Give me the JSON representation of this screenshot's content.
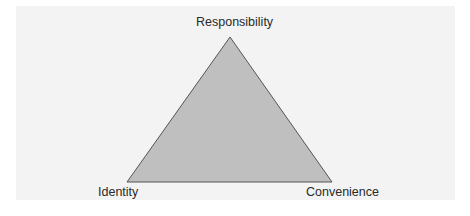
{
  "diagram": {
    "type": "triangle",
    "vertices": {
      "top": "Responsibility",
      "bottom_left": "Identity",
      "bottom_right": "Convenience"
    },
    "colors": {
      "background_panel": "#f3f3f3",
      "triangle_fill": "#bfbfbf",
      "triangle_stroke": "#555555",
      "label_text": "#2a2a2a"
    }
  }
}
